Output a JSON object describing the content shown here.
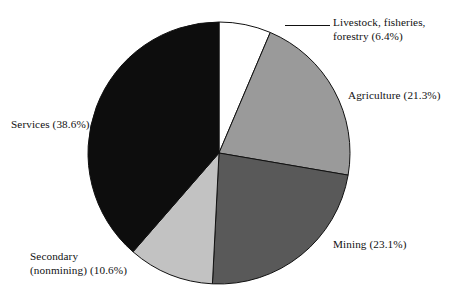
{
  "chart_data": {
    "type": "pie",
    "title": "",
    "subtitle": "",
    "xlabel": "",
    "ylabel": "",
    "legend_position": "none",
    "grid": false,
    "start_angle_deg": 0,
    "direction": "clockwise",
    "units": "percent",
    "categories": [
      "Livestock, fisheries, forestry",
      "Agriculture",
      "Mining",
      "Secondary (nonmining)",
      "Services"
    ],
    "values": [
      6.4,
      21.3,
      23.1,
      10.6,
      38.6
    ],
    "slices": [
      {
        "name": "livestock",
        "label_line1": "Livestock, fisheries,",
        "label_line2": "forestry (6.4%)",
        "label_full": "Livestock, fisheries, forestry (6.4%)",
        "value": 6.4,
        "value_text": "6.4%",
        "color": "#ffffff",
        "stroke": "#111111",
        "has_leader_line": true
      },
      {
        "name": "agriculture",
        "label_line1": "Agriculture (21.3%)",
        "label_line2": "",
        "label_full": "Agriculture (21.3%)",
        "value": 21.3,
        "value_text": "21.3%",
        "color": "#9a9a9a",
        "stroke": "#111111",
        "has_leader_line": false
      },
      {
        "name": "mining",
        "label_line1": "Mining (23.1%)",
        "label_line2": "",
        "label_full": "Mining (23.1%)",
        "value": 23.1,
        "value_text": "23.1%",
        "color": "#595959",
        "stroke": "#111111",
        "has_leader_line": false
      },
      {
        "name": "secondary",
        "label_line1": "Secondary",
        "label_line2": "(nonmining) (10.6%)",
        "label_full": "Secondary (nonmining) (10.6%)",
        "value": 10.6,
        "value_text": "10.6%",
        "color": "#c2c2c2",
        "stroke": "#111111",
        "has_leader_line": false
      },
      {
        "name": "services",
        "label_line1": "Services (38.6%)",
        "label_line2": "",
        "label_full": "Services (38.6%)",
        "value": 38.6,
        "value_text": "38.6%",
        "color": "#0d0d0d",
        "stroke": "#111111",
        "has_leader_line": false
      }
    ],
    "geometry": {
      "center_x": 219,
      "center_y": 153,
      "radius": 131
    }
  }
}
